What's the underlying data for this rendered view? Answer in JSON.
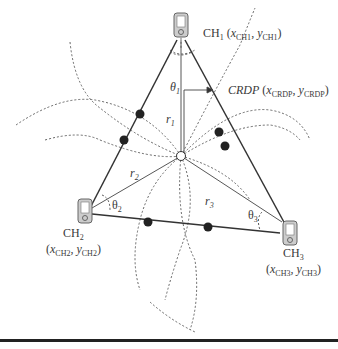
{
  "diagram": {
    "nodes": [
      {
        "id": "CH1",
        "label": "CH",
        "sub": "1",
        "coord_x": "x",
        "coord_x_sub": "CH1",
        "coord_y": "y",
        "coord_y_sub": "CH1"
      },
      {
        "id": "CH2",
        "label": "CH",
        "sub": "2",
        "coord_x": "x",
        "coord_x_sub": "CH2",
        "coord_y": "y",
        "coord_y_sub": "CH2"
      },
      {
        "id": "CH3",
        "label": "CH",
        "sub": "3",
        "coord_x": "x",
        "coord_x_sub": "CH3",
        "coord_y": "y",
        "coord_y_sub": "CH3"
      }
    ],
    "crdp": {
      "label": "CRDP",
      "coord_x": "x",
      "coord_x_sub": "CRDP",
      "coord_y": "y",
      "coord_y_sub": "CRDP"
    },
    "radii": {
      "r1": "r",
      "r1_sub": "1",
      "r2": "r",
      "r2_sub": "2",
      "r3": "r",
      "r3_sub": "3"
    },
    "angles": {
      "t1": "θ",
      "t1_sub": "1",
      "t2": "θ",
      "t2_sub": "2",
      "t3": "θ",
      "t3_sub": "3"
    },
    "colors": {
      "line": "#333333",
      "dot": "#222222",
      "dash": "#555555"
    }
  }
}
